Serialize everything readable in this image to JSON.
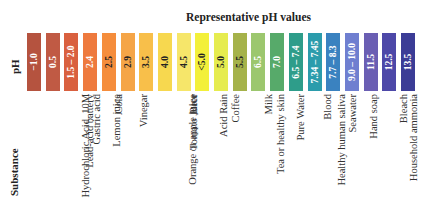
{
  "chart_data": {
    "type": "table",
    "title": "Representative pH values",
    "row_labels": {
      "ph": "pH",
      "substance": "Substance"
    },
    "categories": [
      "Hydrochloric Acid, 10M",
      "Lead-acid battery",
      "Gastric acid",
      "Lemon juice",
      "Cola",
      "Vinegar",
      "Orange or apple juice",
      "Tomato Juice",
      "Beer",
      "Acid Rain",
      "Coffee",
      "Tea or healthy skin",
      "Milk",
      "Pure Water",
      "Healthy human saliva",
      "Blood",
      "Seawater",
      "Hand soap",
      "Household ammonia",
      "Bleach",
      "Household lye"
    ],
    "values": [
      "−1.0",
      "0.5",
      "1.5 – 2.0",
      "2.4",
      "2.5",
      "2.9",
      "3.5",
      "4.0",
      "4.5",
      "<5.0",
      "5.0",
      "5.5",
      "6.5",
      "7.0",
      "6.5 – 7.4",
      "7.34 – 7.45",
      "7.7 – 8.3",
      "9.0 – 10.0",
      "11.5",
      "12.5",
      "13.5"
    ],
    "numeric_values": [
      -1.0,
      0.5,
      1.75,
      2.4,
      2.5,
      2.9,
      3.5,
      4.0,
      4.5,
      5.0,
      5.0,
      5.5,
      6.5,
      7.0,
      6.95,
      7.395,
      8.0,
      9.5,
      11.5,
      12.5,
      13.5
    ],
    "colors": [
      "#b5533f",
      "#c05a44",
      "#d9603f",
      "#ee7a3e",
      "#f58d3c",
      "#f5a547",
      "#f8bf4a",
      "#f7d84f",
      "#f6e66a",
      "#f3f03a",
      "#e6ec4f",
      "#a5b24a",
      "#9cc76e",
      "#57aa6a",
      "#2e9d8a",
      "#2b9cac",
      "#3a82c0",
      "#6f7fd0",
      "#6a5eb3",
      "#4d48a8",
      "#3b3c96"
    ],
    "text_colors": [
      "#ffffff",
      "#ffffff",
      "#ffffff",
      "#ffffff",
      "#222222",
      "#222222",
      "#222222",
      "#222222",
      "#222222",
      "#222222",
      "#222222",
      "#222222",
      "#ffffff",
      "#ffffff",
      "#ffffff",
      "#ffffff",
      "#ffffff",
      "#ffffff",
      "#ffffff",
      "#ffffff",
      "#ffffff"
    ]
  }
}
